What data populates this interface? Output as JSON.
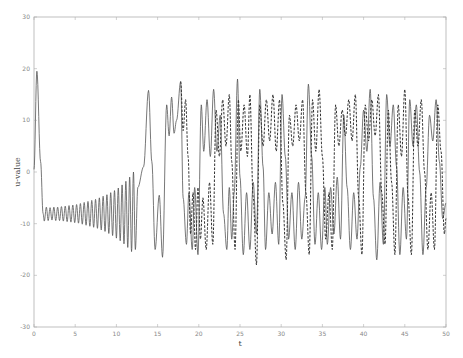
{
  "chart_data": {
    "type": "line",
    "title": "",
    "xlabel": "t",
    "ylabel": "u-value",
    "xlim": [
      0,
      50
    ],
    "ylim": [
      -30,
      30
    ],
    "xticks": [
      0,
      5,
      10,
      15,
      20,
      25,
      30,
      35,
      40,
      45,
      50
    ],
    "yticks": [
      30,
      20,
      10,
      0,
      -10,
      -20,
      -30
    ],
    "grid": false,
    "legend": null,
    "colors": {
      "axis": "#b0b0b0",
      "solid": "#555555",
      "dashed": "#333333"
    },
    "series": [
      {
        "name": "solid",
        "style": "solid",
        "extrema": [
          [
            0,
            0.5
          ],
          [
            0.35,
            19.5
          ],
          [
            0.8,
            2
          ],
          [
            1.1,
            -8
          ],
          [
            1.25,
            -9.5
          ],
          [
            1.5,
            -6.8
          ],
          [
            1.72,
            -9.4
          ],
          [
            1.95,
            -6.9
          ],
          [
            2.18,
            -9.3
          ],
          [
            2.41,
            -6.8
          ],
          [
            2.64,
            -9.4
          ],
          [
            2.87,
            -6.8
          ],
          [
            3.1,
            -9.4
          ],
          [
            3.33,
            -6.7
          ],
          [
            3.56,
            -9.5
          ],
          [
            3.79,
            -6.6
          ],
          [
            4.02,
            -9.6
          ],
          [
            4.25,
            -6.5
          ],
          [
            4.48,
            -9.7
          ],
          [
            4.71,
            -6.4
          ],
          [
            4.94,
            -9.8
          ],
          [
            5.17,
            -6.3
          ],
          [
            5.4,
            -9.9
          ],
          [
            5.63,
            -6.1
          ],
          [
            5.86,
            -10.1
          ],
          [
            6.09,
            -5.9
          ],
          [
            6.32,
            -10.3
          ],
          [
            6.55,
            -5.7
          ],
          [
            6.78,
            -10.5
          ],
          [
            7.01,
            -5.5
          ],
          [
            7.24,
            -10.7
          ],
          [
            7.47,
            -5.3
          ],
          [
            7.7,
            -10.9
          ],
          [
            7.93,
            -5.0
          ],
          [
            8.16,
            -11.2
          ],
          [
            8.39,
            -4.7
          ],
          [
            8.62,
            -11.5
          ],
          [
            8.85,
            -4.4
          ],
          [
            9.08,
            -11.9
          ],
          [
            9.31,
            -4.0
          ],
          [
            9.54,
            -12.3
          ],
          [
            9.77,
            -3.6
          ],
          [
            10.0,
            -12.8
          ],
          [
            10.23,
            -3.1
          ],
          [
            10.46,
            -13.3
          ],
          [
            10.69,
            -2.5
          ],
          [
            10.92,
            -13.9
          ],
          [
            11.15,
            -1.8
          ],
          [
            11.38,
            -14.6
          ],
          [
            11.61,
            -1.0
          ],
          [
            11.84,
            -15.4
          ],
          [
            12.07,
            0
          ],
          [
            12.3,
            -15.0
          ],
          [
            12.6,
            -3
          ],
          [
            13.3,
            1
          ],
          [
            13.9,
            15.8
          ],
          [
            14.3,
            2
          ],
          [
            14.7,
            -15
          ],
          [
            15.2,
            -4.5
          ],
          [
            15.6,
            -16.5
          ],
          [
            16.1,
            13
          ],
          [
            16.4,
            7
          ],
          [
            16.7,
            14.5
          ],
          [
            17.0,
            7.5
          ],
          [
            17.3,
            10
          ],
          [
            17.8,
            17.5
          ],
          [
            18.1,
            -5
          ],
          [
            18.5,
            -14
          ],
          [
            18.8,
            -4
          ],
          [
            19.2,
            -15
          ],
          [
            19.5,
            -3
          ],
          [
            19.9,
            -16
          ],
          [
            20.3,
            13
          ],
          [
            20.6,
            4
          ],
          [
            21.0,
            14
          ],
          [
            21.4,
            3
          ],
          [
            21.8,
            16
          ],
          [
            22.2,
            4
          ],
          [
            22.6,
            11
          ],
          [
            23.0,
            -8
          ],
          [
            23.4,
            -15
          ],
          [
            23.7,
            -3
          ],
          [
            24.0,
            -13
          ],
          [
            24.3,
            -4
          ],
          [
            24.7,
            18
          ],
          [
            25.0,
            -1
          ],
          [
            25.4,
            -16
          ],
          [
            25.8,
            -4
          ],
          [
            26.2,
            -15
          ],
          [
            26.6,
            -2
          ],
          [
            27.0,
            -12
          ],
          [
            27.4,
            16
          ],
          [
            27.8,
            1
          ],
          [
            28.1,
            -15
          ],
          [
            28.5,
            -4
          ],
          [
            28.9,
            -12
          ],
          [
            29.3,
            -2
          ],
          [
            29.7,
            -14
          ],
          [
            30.1,
            15
          ],
          [
            30.5,
            3
          ],
          [
            30.9,
            -13
          ],
          [
            31.3,
            -4
          ],
          [
            31.7,
            -15
          ],
          [
            32.1,
            -2
          ],
          [
            32.5,
            -13
          ],
          [
            32.9,
            -5
          ],
          [
            33.3,
            17
          ],
          [
            33.7,
            3
          ],
          [
            34.1,
            -14
          ],
          [
            34.5,
            -4
          ],
          [
            34.9,
            -15
          ],
          [
            35.3,
            -3
          ],
          [
            35.6,
            -14
          ],
          [
            36.0,
            -3
          ],
          [
            36.4,
            -12
          ],
          [
            36.8,
            -1
          ],
          [
            37.2,
            -13
          ],
          [
            37.6,
            11
          ],
          [
            38.0,
            -3
          ],
          [
            38.4,
            -15
          ],
          [
            38.8,
            -4
          ],
          [
            39.2,
            -13
          ],
          [
            39.6,
            1
          ],
          [
            40.0,
            12
          ],
          [
            40.4,
            4
          ],
          [
            40.8,
            16
          ],
          [
            41.2,
            -5
          ],
          [
            41.6,
            -17
          ],
          [
            42.0,
            -2
          ],
          [
            42.4,
            -14
          ],
          [
            42.8,
            15
          ],
          [
            43.2,
            5
          ],
          [
            43.6,
            13
          ],
          [
            44.0,
            1
          ],
          [
            44.4,
            -16
          ],
          [
            44.8,
            -3
          ],
          [
            45.2,
            -13
          ],
          [
            45.6,
            14
          ],
          [
            46.0,
            5
          ],
          [
            46.4,
            13
          ],
          [
            46.8,
            0
          ],
          [
            47.2,
            -16
          ],
          [
            47.6,
            -3
          ],
          [
            48.0,
            11
          ],
          [
            48.4,
            6
          ],
          [
            48.8,
            14
          ],
          [
            49.2,
            2
          ],
          [
            49.6,
            -9
          ],
          [
            50.0,
            -6
          ]
        ]
      },
      {
        "name": "dashed",
        "style": "dashed",
        "extrema": [
          [
            17.8,
            17.5
          ],
          [
            18.1,
            8
          ],
          [
            18.4,
            14
          ],
          [
            18.7,
            3
          ],
          [
            19.0,
            -12
          ],
          [
            19.3,
            -4
          ],
          [
            19.6,
            -15
          ],
          [
            19.9,
            -3
          ],
          [
            20.2,
            -13
          ],
          [
            20.5,
            -5
          ],
          [
            20.9,
            -15
          ],
          [
            21.3,
            -2
          ],
          [
            21.7,
            -14
          ],
          [
            22.1,
            12
          ],
          [
            22.5,
            3
          ],
          [
            22.9,
            14
          ],
          [
            23.3,
            5
          ],
          [
            23.7,
            15
          ],
          [
            24.0,
            2
          ],
          [
            24.4,
            -15
          ],
          [
            24.8,
            14
          ],
          [
            25.1,
            4
          ],
          [
            25.5,
            13
          ],
          [
            25.9,
            3
          ],
          [
            26.2,
            15
          ],
          [
            26.6,
            -5
          ],
          [
            27.0,
            -18
          ],
          [
            27.4,
            13
          ],
          [
            27.8,
            5
          ],
          [
            28.2,
            14
          ],
          [
            28.6,
            6
          ],
          [
            29.0,
            15
          ],
          [
            29.4,
            4
          ],
          [
            29.8,
            14
          ],
          [
            30.2,
            -6
          ],
          [
            30.6,
            -17
          ],
          [
            31.0,
            11
          ],
          [
            31.4,
            5
          ],
          [
            31.8,
            13
          ],
          [
            32.2,
            6
          ],
          [
            32.6,
            14
          ],
          [
            33.0,
            -4
          ],
          [
            33.4,
            -16
          ],
          [
            33.8,
            14
          ],
          [
            34.2,
            4
          ],
          [
            34.6,
            16
          ],
          [
            35.0,
            3
          ],
          [
            35.4,
            -13
          ],
          [
            35.8,
            -4
          ],
          [
            36.2,
            -15
          ],
          [
            36.6,
            13
          ],
          [
            37.0,
            5
          ],
          [
            37.4,
            12
          ],
          [
            37.8,
            7
          ],
          [
            38.2,
            14
          ],
          [
            38.6,
            6
          ],
          [
            39.0,
            15
          ],
          [
            39.4,
            -5
          ],
          [
            39.8,
            -16
          ],
          [
            40.2,
            13
          ],
          [
            40.6,
            6
          ],
          [
            41.0,
            14
          ],
          [
            41.4,
            7
          ],
          [
            41.8,
            15
          ],
          [
            42.2,
            -4
          ],
          [
            42.6,
            -14
          ],
          [
            43.0,
            12
          ],
          [
            43.4,
            -2
          ],
          [
            43.8,
            -16
          ],
          [
            44.2,
            13
          ],
          [
            44.6,
            3
          ],
          [
            45.0,
            16
          ],
          [
            45.4,
            -5
          ],
          [
            45.8,
            -16
          ],
          [
            46.2,
            12
          ],
          [
            46.6,
            5
          ],
          [
            47.0,
            14
          ],
          [
            47.4,
            0
          ],
          [
            47.8,
            -15
          ],
          [
            48.2,
            -4
          ],
          [
            48.6,
            -15
          ],
          [
            49.0,
            13
          ],
          [
            49.4,
            4
          ],
          [
            49.8,
            -12
          ],
          [
            50.0,
            -9
          ]
        ]
      }
    ]
  }
}
